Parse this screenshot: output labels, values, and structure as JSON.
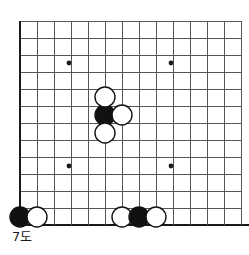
{
  "diagram": {
    "caption": "7도",
    "board": {
      "type": "go-board",
      "grid_spacing": 17,
      "origin_x": 20,
      "origin_y": 21,
      "cols": 13,
      "rows": 12,
      "line_color": "#555555",
      "edge_color": "#1a1a1a",
      "background_color": "#ffffff",
      "line_width": 1,
      "edge_width": 2.2,
      "left_edge_is_board_edge": true,
      "bottom_edge_is_board_edge": true,
      "top_edge_is_board_edge": false,
      "right_edge_is_board_edge": false,
      "star_points": [
        {
          "x": 69,
          "y": 63
        },
        {
          "x": 171,
          "y": 63
        },
        {
          "x": 69,
          "y": 166
        },
        {
          "x": 171,
          "y": 166
        }
      ],
      "star_point_radius": 2.4,
      "star_point_color": "#1a1a1a"
    },
    "stones": {
      "radius": 10,
      "black_fill": "#111111",
      "white_fill": "#ffffff",
      "stone_outline": "#111111",
      "outline_width": 1.4,
      "items": [
        {
          "id": "stone-black-center",
          "color": "black",
          "x": 105,
          "y": 115
        },
        {
          "id": "stone-white-above-center",
          "color": "white",
          "x": 105,
          "y": 97
        },
        {
          "id": "stone-white-right-of-center",
          "color": "white",
          "x": 122,
          "y": 115
        },
        {
          "id": "stone-white-below-center",
          "color": "white",
          "x": 105,
          "y": 133
        },
        {
          "id": "stone-black-bottom-left-corner",
          "color": "black",
          "x": 20,
          "y": 217
        },
        {
          "id": "stone-white-bottom-left",
          "color": "white",
          "x": 37,
          "y": 217
        },
        {
          "id": "stone-white-bottom-left-of-trio",
          "color": "white",
          "x": 122,
          "y": 217
        },
        {
          "id": "stone-black-bottom-trio",
          "color": "black",
          "x": 139,
          "y": 217
        },
        {
          "id": "stone-white-bottom-right-of-trio",
          "color": "white",
          "x": 156,
          "y": 217
        }
      ]
    }
  }
}
